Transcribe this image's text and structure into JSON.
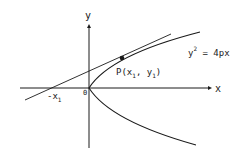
{
  "diagram": {
    "axes": {
      "x_label": "x",
      "y_label": "y",
      "origin_label": "0"
    },
    "curve": {
      "equation_lhs": "y",
      "equation_exp": "2",
      "equation_rhs": " = 4px"
    },
    "point": {
      "label_prefix": "P(x",
      "label_sub1": "1",
      "label_mid": ", y",
      "label_sub2": "1",
      "label_suffix": ")"
    },
    "intercept": {
      "label": "-x",
      "sub": "1"
    },
    "colors": {
      "stroke": "#1a1a1a",
      "background": "#ffffff"
    }
  }
}
